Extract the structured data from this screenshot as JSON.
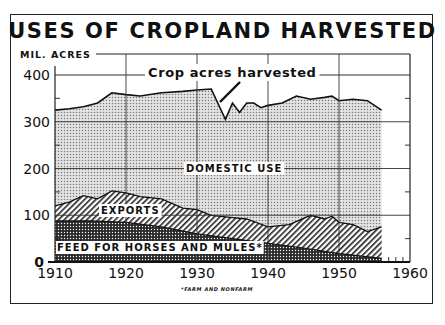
{
  "chart_data": {
    "type": "area",
    "title": "USES OF CROPLAND HARVESTED",
    "ylabel": "MIL. ACRES",
    "xlabel": "",
    "xlim": [
      1910,
      1960
    ],
    "ylim": [
      0,
      400
    ],
    "x_ticks": [
      1910,
      1920,
      1930,
      1940,
      1950,
      1960
    ],
    "y_ticks": [
      0,
      100,
      200,
      300,
      400
    ],
    "grid": true,
    "stacked": true,
    "annotation": "Crop acres harvested",
    "footnote": "*FARM AND NONFARM",
    "series": [
      {
        "name": "FEED FOR HORSES AND MULES*",
        "pattern": "dense-dots",
        "x": [
          1910,
          1915,
          1920,
          1925,
          1930,
          1935,
          1940,
          1945,
          1950,
          1956
        ],
        "values": [
          88,
          88,
          85,
          75,
          60,
          50,
          40,
          30,
          18,
          8
        ]
      },
      {
        "name": "EXPORTS",
        "pattern": "diagonal-hatch",
        "x": [
          1910,
          1912,
          1914,
          1916,
          1918,
          1920,
          1922,
          1925,
          1928,
          1930,
          1932,
          1935,
          1937,
          1940,
          1943,
          1946,
          1948,
          1949,
          1950,
          1952,
          1954,
          1956
        ],
        "values_cumulative_top": [
          120,
          128,
          142,
          135,
          152,
          148,
          140,
          135,
          115,
          112,
          100,
          95,
          92,
          75,
          80,
          100,
          92,
          98,
          85,
          80,
          65,
          75
        ]
      },
      {
        "name": "DOMESTIC USE",
        "pattern": "light-dots",
        "x": [
          1910,
          1912,
          1914,
          1916,
          1918,
          1920,
          1922,
          1925,
          1928,
          1930,
          1932,
          1934,
          1935,
          1936,
          1937,
          1938,
          1939,
          1940,
          1942,
          1944,
          1946,
          1948,
          1949,
          1950,
          1952,
          1954,
          1956
        ],
        "values_cumulative_top": [
          325,
          328,
          332,
          340,
          362,
          358,
          355,
          362,
          365,
          368,
          370,
          305,
          340,
          320,
          340,
          340,
          330,
          335,
          340,
          355,
          348,
          352,
          355,
          345,
          348,
          345,
          325
        ]
      }
    ]
  },
  "labels": {
    "title": "USES OF CROPLAND HARVESTED",
    "y_unit": "MIL. ACRES",
    "annotation": "Crop acres harvested",
    "domestic": "DOMESTIC USE",
    "exports": "EXPORTS",
    "feed": "FEED FOR HORSES AND MULES*",
    "footnote": "*FARM AND NONFARM",
    "yticks": [
      "400",
      "300",
      "200",
      "100",
      "0"
    ],
    "xticks": [
      "1910",
      "1920",
      "1930",
      "1940",
      "1950",
      "1960"
    ]
  }
}
